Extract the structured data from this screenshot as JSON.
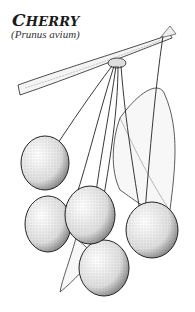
{
  "title": {
    "first_letter": "C",
    "rest": "HERRY"
  },
  "subtitle": "(Prunus avium)",
  "illustration": {
    "subject": "cherry branch with hanging cherries and leaves",
    "style": "black-and-white stippled line drawing",
    "cherry_count": 5,
    "colors": {
      "ink": "#1a1a1a",
      "background": "#ffffff",
      "stipple": "#555555"
    }
  }
}
